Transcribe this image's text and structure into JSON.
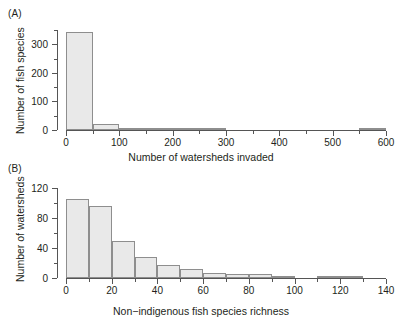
{
  "figure": {
    "panel_a_label": "(A)",
    "panel_b_label": "(B)"
  },
  "chart_data": [
    {
      "type": "bar",
      "panel": "(A)",
      "title": "",
      "xlabel": "Number of watersheds invaded",
      "ylabel": "Number of fish species",
      "xlim": [
        0,
        600
      ],
      "ylim": [
        0,
        350
      ],
      "grid": false,
      "legend": "none",
      "bin_width": 50,
      "bin_edges": [
        0,
        50,
        100,
        150,
        200,
        250,
        300,
        350,
        400,
        450,
        500,
        550,
        600
      ],
      "categories": [
        "0-50",
        "50-100",
        "100-150",
        "150-200",
        "200-250",
        "250-300",
        "300-350",
        "350-400",
        "400-450",
        "450-500",
        "500-550",
        "550-600"
      ],
      "values": [
        342,
        21,
        8,
        4,
        7,
        5,
        0,
        0,
        0,
        0,
        0,
        4
      ],
      "x_ticks_major": [
        0,
        100,
        200,
        300,
        400,
        500,
        600
      ],
      "x_ticks_major_labels": [
        "0",
        "100",
        "200",
        "300",
        "400",
        "500",
        "600"
      ],
      "x_ticks_minor": [
        50,
        150,
        250,
        350,
        450,
        550
      ],
      "y_ticks_major": [
        0,
        100,
        200,
        300
      ],
      "y_ticks_major_labels": [
        "0",
        "100",
        "200",
        "300"
      ],
      "y_ticks_minor": [
        50,
        150,
        250,
        350
      ]
    },
    {
      "type": "bar",
      "panel": "(B)",
      "title": "",
      "xlabel": "Non−indigenous fish species richness",
      "ylabel": "Number of watersheds",
      "xlim": [
        0,
        140
      ],
      "ylim": [
        0,
        120
      ],
      "grid": false,
      "legend": "none",
      "bin_width": 10,
      "bin_edges": [
        0,
        10,
        20,
        30,
        40,
        50,
        60,
        70,
        80,
        90,
        100,
        110,
        120,
        130,
        140
      ],
      "categories": [
        "0-10",
        "10-20",
        "20-30",
        "30-40",
        "40-50",
        "50-60",
        "60-70",
        "70-80",
        "80-90",
        "90-100",
        "100-110",
        "110-120",
        "120-130",
        "130-140"
      ],
      "values": [
        105,
        96,
        50,
        28,
        18,
        12,
        7,
        6,
        5,
        3,
        0,
        1,
        1,
        0
      ],
      "x_ticks_major": [
        0,
        20,
        40,
        60,
        80,
        100,
        120,
        140
      ],
      "x_ticks_major_labels": [
        "0",
        "20",
        "40",
        "60",
        "80",
        "100",
        "120",
        "140"
      ],
      "x_ticks_minor": [
        10,
        30,
        50,
        70,
        90,
        110,
        130
      ],
      "y_ticks_major": [
        0,
        40,
        80,
        120
      ],
      "y_ticks_major_labels": [
        "0",
        "40",
        "80",
        "120"
      ],
      "y_ticks_minor": [
        20,
        60,
        100
      ]
    }
  ],
  "style": {
    "bar_fill": "#e9e9e9",
    "bar_border": "#8e8e8e",
    "axis_color": "#555555",
    "text_color": "#231f20"
  }
}
